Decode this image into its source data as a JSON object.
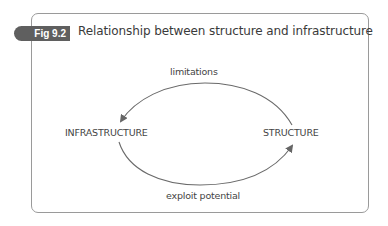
{
  "figure": {
    "label": "Fig 9.2",
    "title": "Relationship between structure and infrastructure"
  },
  "diagram": {
    "nodes": [
      {
        "id": "infrastructure",
        "label": "INFRASTRUCTURE"
      },
      {
        "id": "structure",
        "label": "STRUCTURE"
      }
    ],
    "edges": [
      {
        "from": "structure",
        "to": "infrastructure",
        "label": "limitations",
        "position": "top"
      },
      {
        "from": "infrastructure",
        "to": "structure",
        "label": "exploit potential",
        "position": "bottom"
      }
    ]
  },
  "colors": {
    "tab_background": "#5f5f5f",
    "frame_border": "#9a9a9a",
    "text": "#444444",
    "arrow": "#666666"
  }
}
